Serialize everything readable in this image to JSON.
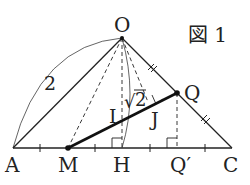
{
  "figure": {
    "title": "図 1",
    "colors": {
      "stroke": "#222222",
      "background": "#ffffff"
    }
  },
  "points": {
    "O": {
      "label": "O",
      "x": 122,
      "y": 38
    },
    "A": {
      "label": "A",
      "x": 13,
      "y": 148
    },
    "C": {
      "label": "C",
      "x": 232,
      "y": 148
    },
    "M": {
      "label": "M",
      "x": 68,
      "y": 148
    },
    "H": {
      "label": "H",
      "x": 122,
      "y": 148
    },
    "Qp": {
      "label": "Q′",
      "x": 177,
      "y": 148
    },
    "Q": {
      "label": "Q",
      "x": 177,
      "y": 93
    },
    "I": {
      "label": "I",
      "x": 122,
      "y": 120
    },
    "J": {
      "label": "J"
    }
  },
  "measurements": {
    "OA": "2",
    "OH_arc": "√2"
  },
  "sqrt_symbol": "√",
  "sqrt_value": "2"
}
